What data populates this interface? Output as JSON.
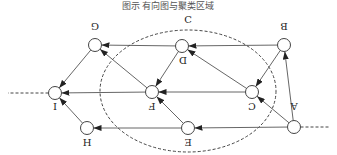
{
  "caption": "图示 有向图与聚类区域",
  "orientation": "rotated-180",
  "cluster": {
    "label": "C",
    "cx": 188,
    "cy": 91,
    "rx": 88,
    "ry": 61
  },
  "nodes": [
    {
      "id": "A",
      "label": "A",
      "x": 294,
      "y": 127,
      "lx": 294,
      "ly": 110
    },
    {
      "id": "B",
      "label": "B",
      "x": 284,
      "y": 45,
      "lx": 284,
      "ly": 30
    },
    {
      "id": "C",
      "label": "C",
      "x": 252,
      "y": 92,
      "lx": 252,
      "ly": 110
    },
    {
      "id": "D",
      "label": "D",
      "x": 182,
      "y": 46,
      "lx": 183,
      "ly": 64
    },
    {
      "id": "E",
      "label": "E",
      "x": 188,
      "y": 128,
      "lx": 188,
      "ly": 146
    },
    {
      "id": "F",
      "label": "F",
      "x": 152,
      "y": 92,
      "lx": 152,
      "ly": 110
    },
    {
      "id": "G",
      "label": "G",
      "x": 95,
      "y": 45,
      "lx": 95,
      "ly": 30
    },
    {
      "id": "H",
      "label": "H",
      "x": 87,
      "y": 128,
      "lx": 87,
      "ly": 146
    },
    {
      "id": "I",
      "label": "I",
      "x": 55,
      "y": 93,
      "lx": 55,
      "ly": 110
    }
  ],
  "edges": [
    [
      "A",
      "B"
    ],
    [
      "A",
      "C"
    ],
    [
      "A",
      "E"
    ],
    [
      "B",
      "C"
    ],
    [
      "B",
      "D"
    ],
    [
      "C",
      "D"
    ],
    [
      "C",
      "F"
    ],
    [
      "D",
      "G"
    ],
    [
      "D",
      "F"
    ],
    [
      "E",
      "F"
    ],
    [
      "E",
      "H"
    ],
    [
      "F",
      "G"
    ],
    [
      "F",
      "I"
    ],
    [
      "G",
      "I"
    ],
    [
      "H",
      "I"
    ]
  ],
  "tails": [
    {
      "from": "A",
      "x2": 330,
      "y2": 127
    },
    {
      "from": "I",
      "x2": 8,
      "y2": 93
    }
  ]
}
